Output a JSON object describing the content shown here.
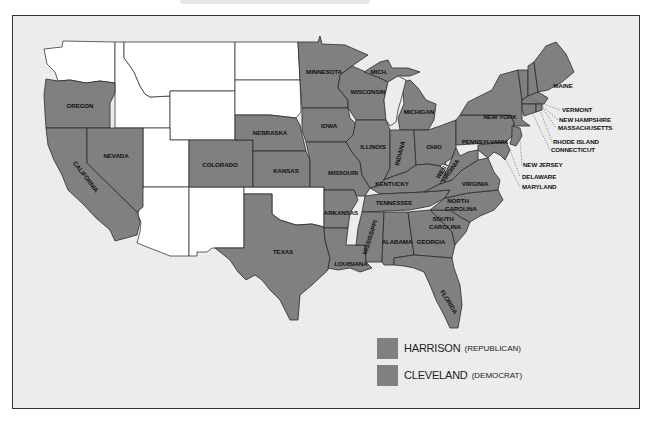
{
  "map": {
    "title": "1888 Presidential Election",
    "colors": {
      "harrison": "#808080",
      "cleveland": "#808080",
      "territory": "#ffffff",
      "water": "#ececec",
      "border": "#2b2b2b"
    },
    "state_labels": {
      "oregon": "OREGON",
      "nevada": "NEVADA",
      "california": "CALIFORNIA",
      "colorado": "COLORADO",
      "nebraska": "NEBRASKA",
      "kansas": "KANSAS",
      "texas": "TEXAS",
      "minnesota": "MINNESOTA",
      "wisconsin": "WISCONSIN",
      "mich": "MICH.",
      "michigan": "MICHIGAN",
      "iowa": "IOWA",
      "illinois": "ILLINOIS",
      "indiana": "INDIANA",
      "ohio": "OHIO",
      "missouri": "MISSOURI",
      "kentucky": "KENTUCKY",
      "west_virginia_1": "WEST",
      "west_virginia_2": "VIRGINIA",
      "virginia": "VIRGINIA",
      "tennessee": "TENNESSEE",
      "north_carolina_1": "NORTH",
      "north_carolina_2": "CAROLINA",
      "south_carolina_1": "SOUTH",
      "south_carolina_2": "CAROLINA",
      "arkansas": "ARKANSAS",
      "mississippi": "MISSISSIPPI",
      "alabama": "ALABAMA",
      "georgia": "GEORGIA",
      "louisiana": "LOUISIANA",
      "florida": "FLORIDA",
      "pennsylvania": "PENNSYLVANIA",
      "new_york": "NEW YORK",
      "maine": "MAINE",
      "vermont": "VERMONT",
      "new_hampshire": "NEW HAMPSHIRE",
      "massachusetts": "MASSACHUSETTS",
      "rhode_island": "RHODE ISLAND",
      "connecticut": "CONNECTICUT",
      "new_jersey": "NEW JERSEY",
      "delaware": "DELAWARE",
      "maryland": "MARYLAND"
    }
  },
  "legend": {
    "items": [
      {
        "name": "HARRISON",
        "party": "(REPUBLICAN)",
        "color": "#808080"
      },
      {
        "name": "CLEVELAND",
        "party": "(DEMOCRAT)",
        "color": "#808080"
      }
    ]
  }
}
